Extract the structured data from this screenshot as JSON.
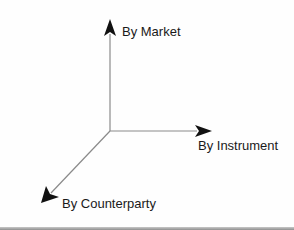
{
  "diagram": {
    "type": "3d-axes",
    "origin": {
      "x": 110,
      "y": 131
    },
    "colors": {
      "axis_line": "#8a8a8a",
      "arrowhead": "#111111",
      "label_text": "#1a1a1a",
      "background": "#fefefe"
    },
    "axes": [
      {
        "id": "market",
        "label": "By Market",
        "direction": "up",
        "icon": "arrow-up-icon"
      },
      {
        "id": "instrument",
        "label": "By Instrument",
        "direction": "right",
        "icon": "arrow-right-icon"
      },
      {
        "id": "counterparty",
        "label": "By Counterparty",
        "direction": "down-left",
        "icon": "arrow-down-left-icon"
      }
    ]
  }
}
